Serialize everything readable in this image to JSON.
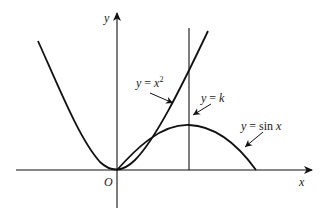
{
  "diagram": {
    "type": "function-graph",
    "axes": {
      "x_label": "x",
      "y_label": "y",
      "origin_label": "O"
    },
    "curves": [
      {
        "id": "parabola",
        "label_lhs": "y",
        "label_eq": " = ",
        "label_rhs": "x",
        "label_sup": "2",
        "full_label": "y = x^2"
      },
      {
        "id": "vertical-line",
        "label_lhs": "y",
        "label_eq": " = ",
        "label_rhs": "k",
        "full_label": "y = k"
      },
      {
        "id": "sine",
        "label_lhs": "y",
        "label_eq": " = sin ",
        "label_rhs": "x",
        "full_label": "y = sin x"
      }
    ],
    "colors": {
      "stroke": "#111111",
      "background": "#ffffff"
    }
  }
}
